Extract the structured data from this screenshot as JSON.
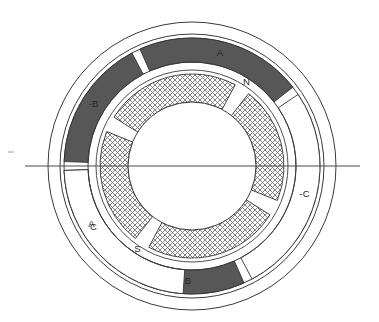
{
  "figure": {
    "type": "machine-cross-section",
    "background_color": "#ffffff",
    "line_color": "#333333",
    "segment_fill_dark": "#575757",
    "segment_fill_light": "#ffffff",
    "rotor_hatch_color": "#6e6e6e",
    "label_color": "#262626"
  },
  "geometry": {
    "center_x": 192,
    "center_y": 166,
    "outer_housing_radius": 144,
    "housing_inner_radius": 132,
    "stator_segment_outer_radius": 128,
    "stator_segment_inner_radius": 104,
    "airgap_inner_radius": 96,
    "rotor_outer_radius": 92,
    "rotor_inner_radius": 64,
    "axis_line_y": 166,
    "axis_line_x_start": 25,
    "axis_line_x_end": 360
  },
  "stator": {
    "name": "stator-ring",
    "segments": [
      {
        "label": "-B",
        "shade": "dark",
        "start_deg": 118,
        "end_deg": 178,
        "label_radius": 116,
        "label_deg": 148
      },
      {
        "label": "A",
        "shade": "dark",
        "start_deg": 38,
        "end_deg": 114,
        "label_radius": 116,
        "label_deg": 76
      },
      {
        "label": "-C",
        "shade": "light",
        "start_deg": -62,
        "end_deg": 34,
        "label_radius": 116,
        "label_deg": -14
      },
      {
        "label": "B",
        "shade": "dark",
        "start_deg": -118,
        "end_deg": -66,
        "label_radius": 116,
        "label_deg": -92
      },
      {
        "label": "A",
        "shade": "dark",
        "start_deg": -178,
        "end_deg": -122,
        "label_radius": 116,
        "label_deg": -150
      },
      {
        "label": "C",
        "shade": "light",
        "start_deg": 182,
        "end_deg": 266,
        "label_radius": 116,
        "label_deg": 212
      }
    ]
  },
  "rotor": {
    "name": "rotor-ring",
    "hatched": true,
    "poles": [
      {
        "label": "N",
        "gap_start_deg": 52,
        "gap_end_deg": 62,
        "label_radius": 100,
        "label_deg": 57
      },
      {
        "label": "S",
        "gap_start_deg": -128,
        "gap_end_deg": -118,
        "label_radius": 100,
        "label_deg": -123
      }
    ],
    "arc_gaps": [
      {
        "start_deg": 52,
        "end_deg": 62
      },
      {
        "start_deg": 148,
        "end_deg": 158
      },
      {
        "start_deg": -128,
        "end_deg": -118
      },
      {
        "start_deg": -32,
        "end_deg": -22
      }
    ]
  },
  "labels": {
    "stator_top": "-B",
    "stator_right": "A",
    "stator_lower_right": "-C",
    "stator_bottom": "B",
    "stator_lower_left": "A",
    "stator_upper_left": "C",
    "rotor_north": "N",
    "rotor_south": "S"
  }
}
